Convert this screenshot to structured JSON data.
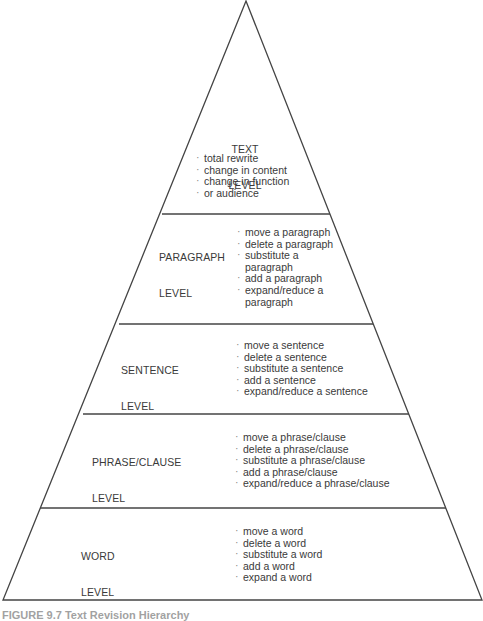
{
  "diagram": {
    "type": "pyramid",
    "colors": {
      "line": "#444444",
      "text": "#3a3a3a",
      "background": "#ffffff"
    },
    "levels": [
      {
        "label_line1": "TEXT",
        "label_line2": "LEVEL",
        "items": [
          "total rewrite",
          "change in content",
          "change in function",
          "or audience"
        ]
      },
      {
        "label_line1": "PARAGRAPH",
        "label_line2": "LEVEL",
        "items": [
          "move a paragraph",
          "delete a paragraph",
          "substitute a",
          "paragraph",
          "add a paragraph",
          "expand/reduce a",
          "paragraph"
        ]
      },
      {
        "label_line1": "SENTENCE",
        "label_line2": "LEVEL",
        "items": [
          "move a sentence",
          "delete a sentence",
          "substitute a sentence",
          "add a sentence",
          "expand/reduce a sentence"
        ]
      },
      {
        "label_line1": "PHRASE/CLAUSE",
        "label_line2": "LEVEL",
        "items": [
          "move a phrase/clause",
          "delete a phrase/clause",
          "substitute a phrase/clause",
          "add a phrase/clause",
          "expand/reduce a phrase/clause"
        ]
      },
      {
        "label_line1": "WORD",
        "label_line2": "LEVEL",
        "items": [
          "move a word",
          "delete a word",
          "substitute a word",
          "add a word",
          "expand a word"
        ]
      }
    ]
  },
  "caption": "FIGURE 9.7 Text Revision Hierarchy"
}
